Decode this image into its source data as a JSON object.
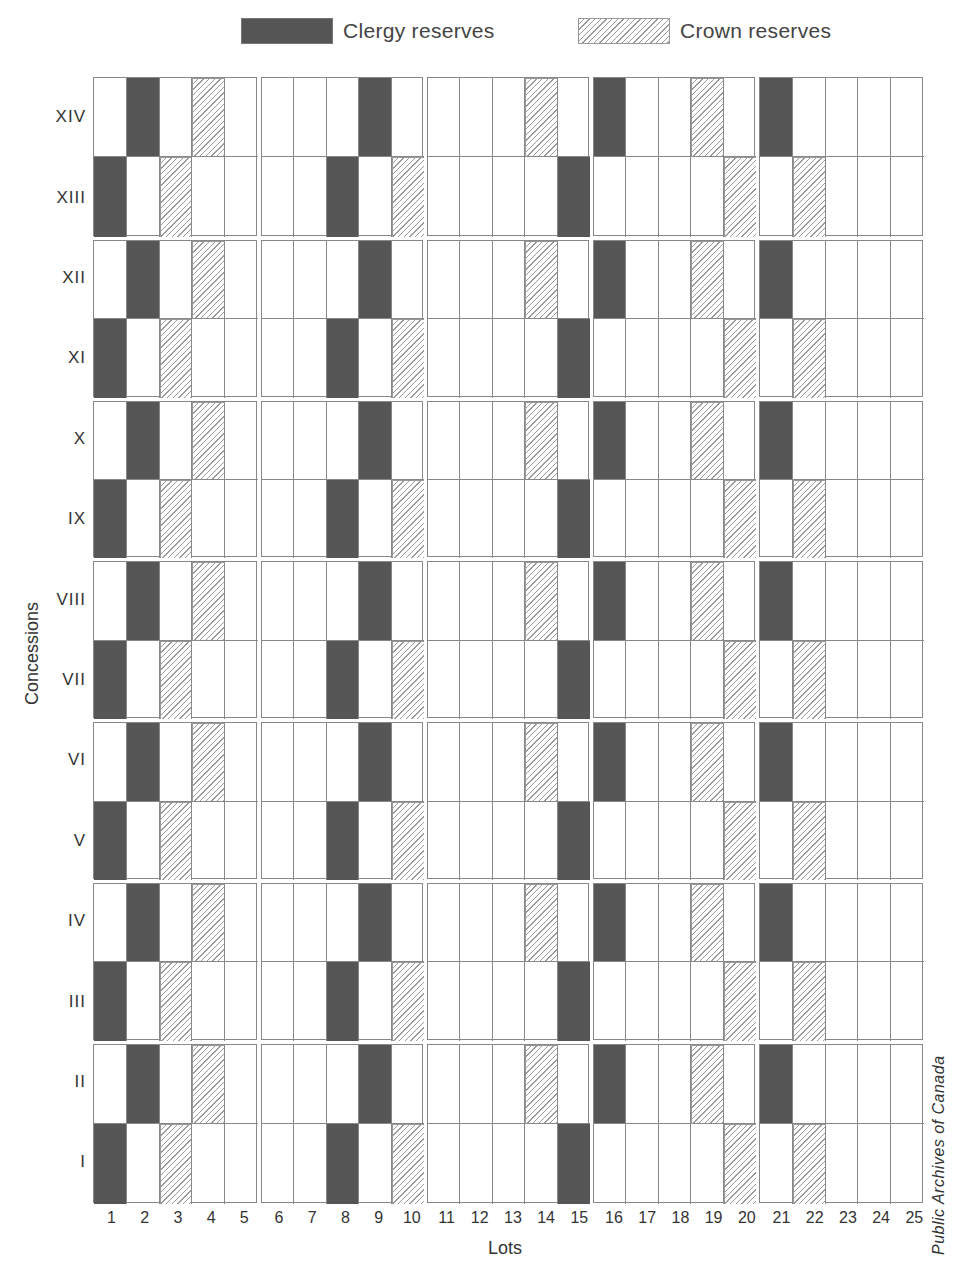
{
  "chart_data": {
    "type": "heatmap",
    "title": "",
    "legend": [
      {
        "key": "clergy",
        "label": "Clergy reserves",
        "color": "#565656"
      },
      {
        "key": "crown",
        "label": "Crown reserves",
        "color": "#9a9a9a",
        "pattern": "diagonal-hatch"
      }
    ],
    "legend_position": "top",
    "xlabel": "Lots",
    "ylabel": "Concessions",
    "x": [
      "1",
      "2",
      "3",
      "4",
      "5",
      "6",
      "7",
      "8",
      "9",
      "10",
      "11",
      "12",
      "13",
      "14",
      "15",
      "16",
      "17",
      "18",
      "19",
      "20",
      "21",
      "22",
      "23",
      "24",
      "25"
    ],
    "y_top_to_bottom": [
      "XIV",
      "XIII",
      "XII",
      "XI",
      "X",
      "IX",
      "VIII",
      "VII",
      "VI",
      "V",
      "IV",
      "III",
      "II",
      "I"
    ],
    "cells": {
      "XIV": {
        "clergy": [
          2,
          9,
          16,
          21
        ],
        "crown": [
          4,
          14,
          19
        ]
      },
      "XIII": {
        "clergy": [
          1,
          8,
          15
        ],
        "crown": [
          3,
          10,
          20,
          22
        ]
      },
      "XII": {
        "clergy": [
          2,
          9,
          16,
          21
        ],
        "crown": [
          4,
          14,
          19
        ]
      },
      "XI": {
        "clergy": [
          1,
          8,
          15
        ],
        "crown": [
          3,
          10,
          20,
          22
        ]
      },
      "X": {
        "clergy": [
          2,
          9,
          16,
          21
        ],
        "crown": [
          4,
          14,
          19
        ]
      },
      "IX": {
        "clergy": [
          1,
          8,
          15
        ],
        "crown": [
          3,
          10,
          20,
          22
        ]
      },
      "VIII": {
        "clergy": [
          2,
          9,
          16,
          21
        ],
        "crown": [
          4,
          14,
          19
        ]
      },
      "VII": {
        "clergy": [
          1,
          8,
          15
        ],
        "crown": [
          3,
          10,
          20,
          22
        ]
      },
      "VI": {
        "clergy": [
          2,
          9,
          16,
          21
        ],
        "crown": [
          4,
          14,
          19
        ]
      },
      "V": {
        "clergy": [
          1,
          8,
          15
        ],
        "crown": [
          3,
          10,
          20,
          22
        ]
      },
      "IV": {
        "clergy": [
          2,
          9,
          16,
          21
        ],
        "crown": [
          4,
          14,
          19
        ]
      },
      "III": {
        "clergy": [
          1,
          8,
          15
        ],
        "crown": [
          3,
          10,
          20,
          22
        ]
      },
      "II": {
        "clergy": [
          2,
          9,
          16,
          21
        ],
        "crown": [
          4,
          14,
          19
        ]
      },
      "I": {
        "clergy": [
          1,
          8,
          15
        ],
        "crown": [
          3,
          10,
          20,
          22
        ]
      }
    },
    "grouping": {
      "lots_per_block": 5,
      "concessions_per_block": 2
    },
    "grid": true
  },
  "labels": {
    "clergy": "Clergy reserves",
    "crown": "Crown reserves",
    "xlabel": "Lots",
    "ylabel": "Concessions",
    "credit": "Public Archives of Canada"
  },
  "colors": {
    "clergy": "#565656",
    "crown_hatch": "#9a9a9a",
    "grid": "#888888"
  }
}
